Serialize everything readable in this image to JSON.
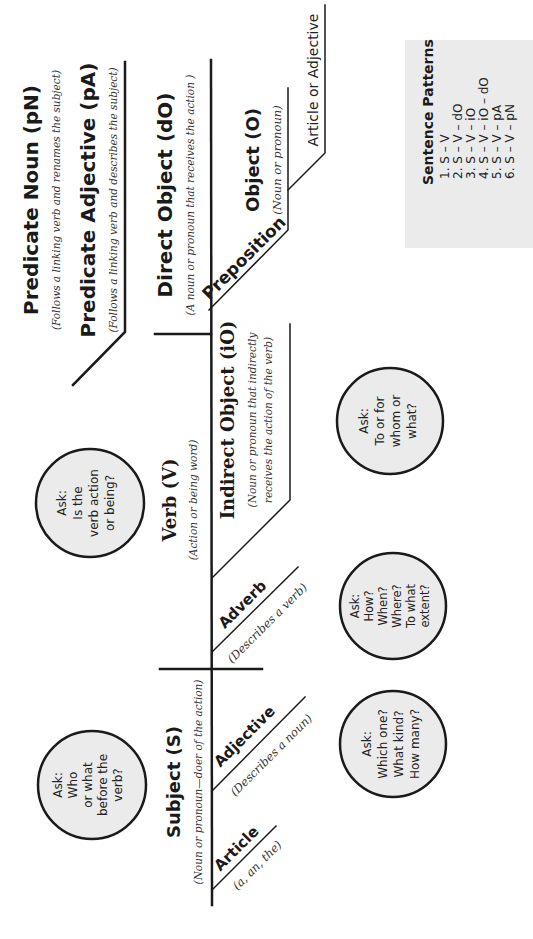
{
  "diagram": {
    "predicate_noun": {
      "label": "Predicate Noun (pN)",
      "note": "(Follows a linking verb and renames the subject)"
    },
    "predicate_adjective": {
      "label": "Predicate Adjective (pA)",
      "note": "(Follows a linking verb and describes the subject)"
    },
    "direct_object": {
      "label": "Direct Object (dO)",
      "note": "(A noun or pronoun that receives the action )"
    },
    "preposition": {
      "label": "Preposition"
    },
    "object": {
      "label": "Object (O)",
      "note": "(Noun or pronoun)"
    },
    "article_or_adjective": {
      "label": "Article or Adjective"
    },
    "verb": {
      "label": "Verb (V)",
      "note": "(Action or being word)"
    },
    "indirect_object": {
      "label": "Indirect Object (iO)",
      "note_line1": "(Noun or pronoun that indirectly",
      "note_line2": "receives the action of the verb)"
    },
    "adverb": {
      "label": "Adverb",
      "note": "(Describes a verb)"
    },
    "subject": {
      "label": "Subject (S)",
      "note": "(Noun or pronoun—doer of the action)"
    },
    "adjective": {
      "label": "Adjective",
      "note": "(Describes a noun)"
    },
    "article": {
      "label": "Article",
      "note": "(a, an, the)"
    }
  },
  "questions": [
    {
      "lines": [
        "Ask:",
        "Is the",
        "verb action",
        "or being?"
      ]
    },
    {
      "lines": [
        "Ask:",
        "Who",
        "or what",
        "before the",
        "verb?"
      ]
    },
    {
      "lines": [
        "Ask:",
        "To or for",
        "whom or",
        "what?"
      ]
    },
    {
      "lines": [
        "Ask:",
        "How?",
        "When?",
        "Where?",
        "To what",
        "extent?"
      ]
    },
    {
      "lines": [
        "Ask:",
        "Which one?",
        "What kind?",
        "How many?"
      ]
    }
  ],
  "sentence_patterns": {
    "title": "Sentence Patterns",
    "items": [
      "1. S – V",
      "2. S – V – dO",
      "3. S – V – iO",
      "4. S – V – iO – dO",
      "5. S – V – pA",
      "6. S – V – pN"
    ]
  },
  "colors": {
    "circle_fill": "#ebebeb",
    "box_fill": "#ebebeb",
    "line": "#1a1a1a"
  }
}
